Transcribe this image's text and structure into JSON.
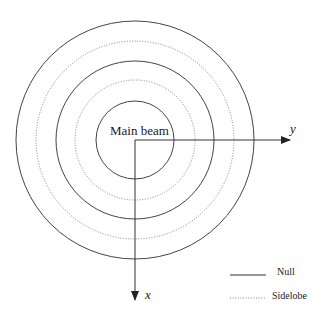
{
  "diagram": {
    "center_label": "Main beam",
    "axes": {
      "x_label": "x",
      "y_label": "y"
    },
    "rings": [
      {
        "radius": 39,
        "type": "null"
      },
      {
        "radius": 60,
        "type": "sidelobe"
      },
      {
        "radius": 79,
        "type": "null"
      },
      {
        "radius": 99,
        "type": "sidelobe"
      },
      {
        "radius": 119,
        "type": "null"
      }
    ],
    "legend": [
      {
        "label": "Null",
        "style": "solid"
      },
      {
        "label": "Sidelobe",
        "style": "dotted"
      }
    ],
    "colors": {
      "line": "#333333",
      "text": "#1a1a1a"
    }
  }
}
